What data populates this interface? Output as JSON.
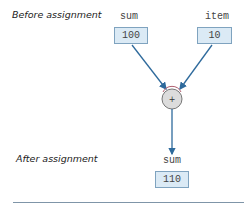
{
  "before_label": "Before assignment",
  "after_label": "After assignment",
  "before": {
    "sum": {
      "name": "sum",
      "value": "100"
    },
    "item": {
      "name": "item",
      "value": "10"
    }
  },
  "operator": {
    "symbol": "+"
  },
  "after": {
    "sum": {
      "name": "sum",
      "value": "110"
    }
  },
  "colors": {
    "arrow": "#2e6a9c",
    "box_fill": "#dbeaf5",
    "box_border": "#7fa3bf",
    "operator_fill": "#d9d9d9"
  }
}
